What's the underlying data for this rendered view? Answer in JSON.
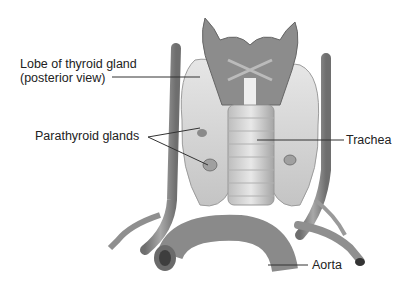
{
  "figure": {
    "colors": {
      "background": "#ffffff",
      "tissue": "#9a9a9a",
      "vessel": "#8a8a8a",
      "light_tissue": "#d8d8d8",
      "leader_line": "#333333",
      "text": "#222222"
    }
  },
  "labels": {
    "thyroid_lobe_line1": "Lobe of thyroid gland",
    "thyroid_lobe_line2": "(posterior view)",
    "parathyroid": "Parathyroid glands",
    "trachea": "Trachea",
    "aorta": "Aorta"
  }
}
